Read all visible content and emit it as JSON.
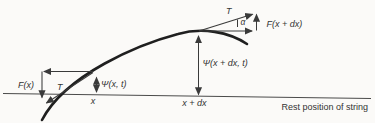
{
  "diagram": {
    "labels": {
      "tension_left": "T",
      "tension_right": "T",
      "force_left": "F(x)",
      "force_right": "F(x + dx)",
      "displacement_left": "Ψ(x, t)",
      "displacement_right": "Ψ(x + dx, t)",
      "angle": "α",
      "position_left": "x",
      "position_right": "x + dx",
      "baseline": "Rest position of string"
    },
    "colors": {
      "background": "#fbfaf8",
      "ink": "#333333",
      "curve": "#1f1f1f"
    }
  }
}
